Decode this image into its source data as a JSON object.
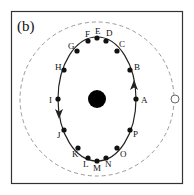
{
  "panel_label": "(b)",
  "colors": {
    "frame": "#333333",
    "orbit": "#222222",
    "dashed_circle": "#9a9a9a",
    "central_body": "#000000",
    "points": "#111111",
    "open_circle_fill": "#ffffff",
    "open_circle_stroke": "#666666"
  },
  "orbit": {
    "center": [
      97,
      99
    ],
    "rx": 39,
    "ry": 62,
    "direction": "counterclockwise"
  },
  "dashed_circle": {
    "center": [
      97,
      99
    ],
    "r": 77
  },
  "central_body": {
    "center": [
      97,
      99
    ],
    "r": 9
  },
  "open_circle": {
    "center": [
      175,
      99
    ],
    "r": 4
  },
  "points": [
    {
      "label": "A",
      "x": 136,
      "y": 99,
      "lx": 141,
      "ly": 103
    },
    {
      "label": "B",
      "x": 130,
      "y": 70,
      "lx": 134,
      "ly": 70
    },
    {
      "label": "C",
      "x": 117,
      "y": 51,
      "lx": 119,
      "ly": 47
    },
    {
      "label": "D",
      "x": 106,
      "y": 41,
      "lx": 106,
      "ly": 36
    },
    {
      "label": "E",
      "x": 97,
      "y": 38,
      "lx": 95,
      "ly": 34
    },
    {
      "label": "F",
      "x": 88,
      "y": 41,
      "lx": 85,
      "ly": 37
    },
    {
      "label": "G",
      "x": 77,
      "y": 51,
      "lx": 68,
      "ly": 49
    },
    {
      "label": "H",
      "x": 64,
      "y": 70,
      "lx": 55,
      "ly": 70
    },
    {
      "label": "I",
      "x": 58,
      "y": 99,
      "lx": 49,
      "ly": 103
    },
    {
      "label": "J",
      "x": 64,
      "y": 130,
      "lx": 57,
      "ly": 138
    },
    {
      "label": "K",
      "x": 78,
      "y": 148,
      "lx": 72,
      "ly": 157
    },
    {
      "label": "L",
      "x": 88,
      "y": 158,
      "lx": 83,
      "ly": 167
    },
    {
      "label": "M",
      "x": 97,
      "y": 161,
      "lx": 93,
      "ly": 171
    },
    {
      "label": "N",
      "x": 106,
      "y": 158,
      "lx": 105,
      "ly": 167
    },
    {
      "label": "O",
      "x": 117,
      "y": 148,
      "lx": 120,
      "ly": 157
    },
    {
      "label": "P",
      "x": 130,
      "y": 130,
      "lx": 133,
      "ly": 137
    }
  ],
  "arrows": [
    {
      "name": "arrow-right-up",
      "x": 134,
      "y": 86,
      "angle": -90
    },
    {
      "name": "arrow-left-down",
      "x": 59,
      "y": 113,
      "angle": 90
    }
  ]
}
